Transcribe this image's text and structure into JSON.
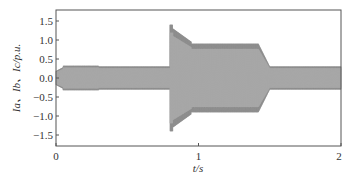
{
  "chart_data": {
    "type": "line",
    "title": "",
    "xlabel": "t/s",
    "ylabel": "Ia、Ib、Ic/p.u.",
    "xlim": [
      0,
      2
    ],
    "ylim": [
      -1.75,
      1.75
    ],
    "x_ticks": [
      "0",
      "1",
      "2"
    ],
    "y_ticks": [
      "1.5",
      "1.0",
      "0.5",
      "0.0",
      "−0.5",
      "−1.0",
      "−1.5"
    ],
    "grid": false,
    "legend": null,
    "series": [
      {
        "name": "Ia, Ib, Ic (envelope)",
        "color": "#8c8c8c",
        "segments": [
          {
            "t_start": 0.0,
            "t_end": 0.05,
            "amplitude": 0.2
          },
          {
            "t_start": 0.05,
            "t_end": 0.3,
            "amplitude": 0.32
          },
          {
            "t_start": 0.3,
            "t_end": 0.8,
            "amplitude": 0.3
          },
          {
            "t_start": 0.8,
            "t_end": 0.82,
            "amplitude": 1.4
          },
          {
            "t_start": 0.82,
            "t_end": 0.95,
            "amplitude": 1.0
          },
          {
            "t_start": 0.95,
            "t_end": 1.42,
            "amplitude": 0.9
          },
          {
            "t_start": 1.42,
            "t_end": 1.5,
            "amplitude": 0.45
          },
          {
            "t_start": 1.5,
            "t_end": 2.0,
            "amplitude": 0.3
          }
        ]
      }
    ]
  },
  "labels": {
    "xlabel": "t/s",
    "ylabel": "Ia、Ib、Ic/p.u."
  }
}
